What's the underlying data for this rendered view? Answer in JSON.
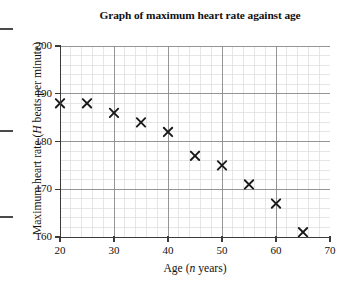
{
  "chart_data": {
    "type": "scatter",
    "title": "Graph of maximum heart rate against age",
    "xlabel_parts": {
      "pre": "Age (",
      "var": "n",
      "post": " years)"
    },
    "ylabel_parts": {
      "pre": "Maximum heart rate (",
      "var": "H",
      "post": " beats per minute)"
    },
    "xlabel": "Age (n years)",
    "ylabel": "Maximum heart rate (H beats per minute)",
    "xlim": [
      20,
      70
    ],
    "ylim": [
      160,
      200
    ],
    "xticks": [
      20,
      30,
      40,
      50,
      60,
      70
    ],
    "yticks": [
      160,
      170,
      180,
      190,
      200
    ],
    "x_minor_step": 2,
    "y_minor_step": 2,
    "grid": true,
    "legend": null,
    "marker": "x-cross",
    "marker_color": "#1a1a1a",
    "grid_major_color": "#8a8a8a",
    "grid_minor_color": "#dcdcdc",
    "axis_color": "#3b3b3b",
    "x": [
      20,
      25,
      30,
      35,
      40,
      45,
      50,
      55,
      60,
      65
    ],
    "y": [
      188,
      188,
      186,
      184,
      182,
      177,
      175,
      171,
      167,
      161
    ],
    "points": [
      {
        "x": 20,
        "y": 188
      },
      {
        "x": 25,
        "y": 188
      },
      {
        "x": 30,
        "y": 186
      },
      {
        "x": 35,
        "y": 184
      },
      {
        "x": 40,
        "y": 182
      },
      {
        "x": 45,
        "y": 177
      },
      {
        "x": 50,
        "y": 175
      },
      {
        "x": 55,
        "y": 171
      },
      {
        "x": 60,
        "y": 167
      },
      {
        "x": 65,
        "y": 161
      }
    ]
  }
}
